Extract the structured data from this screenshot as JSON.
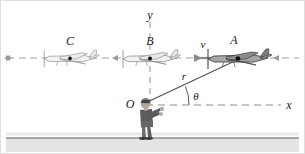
{
  "figure": {
    "type": "physics-kinematics-diagram",
    "background_color": "#ffffff",
    "border_color": "#d8d8d8",
    "ground": {
      "label_name": "ground-band",
      "top_color": "#8c8c8c",
      "band_color": "#e2e2e2",
      "y": 137,
      "height": 17
    }
  },
  "axes": {
    "x_axis": {
      "label": "x",
      "style": "dashed",
      "color": "#707070",
      "x1": 142,
      "x2": 282,
      "y": 105,
      "label_x": 288,
      "label_y": 108
    },
    "y_axis": {
      "label": "y",
      "style": "dashed",
      "color": "#707070",
      "x": 150,
      "y1": 22,
      "y2": 105,
      "label_x": 150,
      "label_y": 17
    },
    "flight_path": {
      "name": "flight-path-axis",
      "style": "dashed-with-arrows",
      "color": "#9a9a9a",
      "y": 58,
      "x1": 6,
      "x2": 299
    }
  },
  "planes": [
    {
      "label": "C",
      "name": "airplane-c",
      "cx": 70,
      "cy": 58,
      "label_x": 70,
      "label_y": 42,
      "fill": "#f2f2f2",
      "stroke": "#9e9e9e",
      "shade": "#d9d9d9",
      "marker_color": "#000000",
      "scale": 0.86
    },
    {
      "label": "B",
      "name": "airplane-b",
      "cx": 150,
      "cy": 58,
      "label_x": 150,
      "label_y": 42,
      "fill": "#efefef",
      "stroke": "#8f8f8f",
      "shade": "#cfcfcf",
      "marker_color": "#000000",
      "scale": 0.9
    },
    {
      "label": "A",
      "name": "airplane-a",
      "cx": 238,
      "cy": 58,
      "label_x": 234,
      "label_y": 42,
      "fill": "#9a9a9a",
      "stroke": "#4a4a4a",
      "shade": "#6e6e6e",
      "marker_color": "#000000",
      "scale": 1.0
    }
  ],
  "vectors": {
    "velocity": {
      "label": "v",
      "name": "velocity-vector",
      "color": "#8a8a8a",
      "x_tail": 222,
      "x_head": 190,
      "y": 58,
      "label_x": 203,
      "label_y": 47
    },
    "radius": {
      "label": "r",
      "name": "radius-vector",
      "color": "#555555",
      "x1": 143,
      "y1": 104,
      "x2": 237,
      "y2": 60,
      "label_x": 183,
      "label_y": 79
    }
  },
  "angle": {
    "label": "θ",
    "name": "angle-theta",
    "vertex_x": 143,
    "vertex_y": 104,
    "arc_radius": 46,
    "label_x": 195,
    "label_y": 99,
    "color": "#555555"
  },
  "origin": {
    "label": "O",
    "name": "origin-label",
    "x": 130,
    "y": 107
  },
  "observer": {
    "name": "observer-figure",
    "x": 145,
    "y": 104,
    "body_color": "#5c5c5c",
    "skin_color": "#b9b0a6",
    "hair_color": "#3d3d3d",
    "leg_color": "#6b6b6b"
  }
}
